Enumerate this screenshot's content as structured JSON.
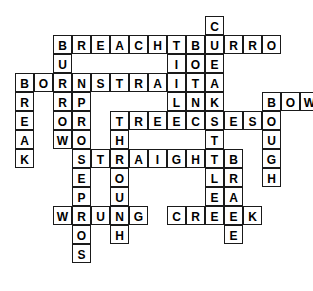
{
  "puzzle": {
    "title": "Crossword Grid",
    "grid": {
      "cell_size": 19,
      "origin_x": 15,
      "origin_y": 16,
      "columns": 16,
      "rows": 15,
      "cell_background": "#ffffff",
      "cell_border": "#1a1a1a",
      "letter_color": "#000000",
      "page_background": "#ffffff"
    },
    "entries": [
      {
        "word": "CREAK",
        "direction": "down",
        "col": 10,
        "row": 0
      },
      {
        "word": "BREACHES",
        "direction": "across",
        "col": 2,
        "row": 1
      },
      {
        "word": "BURRO",
        "direction": "across",
        "col": 9,
        "row": 1
      },
      {
        "word": "BORNE",
        "direction": "down",
        "col": 9,
        "row": 1
      },
      {
        "word": "BURROW",
        "direction": "down",
        "col": 2,
        "row": 1
      },
      {
        "word": "TILL",
        "direction": "down",
        "col": 8,
        "row": 1
      },
      {
        "word": "BORN",
        "direction": "across",
        "col": 0,
        "row": 3
      },
      {
        "word": "STRAIT",
        "direction": "across",
        "col": 4,
        "row": 3
      },
      {
        "word": "BREAK",
        "direction": "down",
        "col": 0,
        "row": 3
      },
      {
        "word": "PROSE",
        "direction": "down",
        "col": 3,
        "row": 4
      },
      {
        "word": "BOW",
        "direction": "across",
        "col": 13,
        "row": 4
      },
      {
        "word": "BOUGH",
        "direction": "down",
        "col": 13,
        "row": 4
      },
      {
        "word": "BREECHES",
        "direction": "across",
        "col": 5,
        "row": 5
      },
      {
        "word": "STYLE",
        "direction": "down",
        "col": 10,
        "row": 5
      },
      {
        "word": "STRAIGHT",
        "direction": "across",
        "col": 3,
        "row": 7
      },
      {
        "word": "THROUGH",
        "direction": "down",
        "col": 5,
        "row": 5
      },
      {
        "word": "BRAKE",
        "direction": "down",
        "col": 11,
        "row": 7
      },
      {
        "word": "PROS",
        "direction": "down",
        "col": 3,
        "row": 9
      },
      {
        "word": "WRUNG",
        "direction": "across",
        "col": 2,
        "row": 10
      },
      {
        "word": "CREEK",
        "direction": "across",
        "col": 8,
        "row": 10
      }
    ],
    "letters": [
      {
        "ch": "C",
        "col": 10,
        "row": 0
      },
      {
        "ch": "B",
        "col": 2,
        "row": 1
      },
      {
        "ch": "R",
        "col": 3,
        "row": 1
      },
      {
        "ch": "E",
        "col": 4,
        "row": 1
      },
      {
        "ch": "A",
        "col": 5,
        "row": 1
      },
      {
        "ch": "C",
        "col": 6,
        "row": 1
      },
      {
        "ch": "H",
        "col": 7,
        "row": 1
      },
      {
        "ch": "E",
        "col": 8,
        "row": 1
      },
      {
        "ch": "S",
        "col": 9,
        "row": 1
      },
      {
        "ch": "B",
        "col": 9,
        "row": 1,
        "skip": true
      },
      {
        "ch": "B",
        "col": 9.45,
        "row": 1,
        "hidden": true
      },
      {
        "ch": "U",
        "col": 2,
        "row": 2
      },
      {
        "ch": "T",
        "col": 8,
        "row": 2
      },
      {
        "ch": "B",
        "col": 0,
        "row": 3
      },
      {
        "ch": "O",
        "col": 1,
        "row": 3
      },
      {
        "ch": "R",
        "col": 2,
        "row": 3
      },
      {
        "ch": "N",
        "col": 3,
        "row": 3
      },
      {
        "ch": "S",
        "col": 4,
        "row": 3
      },
      {
        "ch": "T",
        "col": 5,
        "row": 3
      },
      {
        "ch": "R",
        "col": 6,
        "row": 3
      },
      {
        "ch": "A",
        "col": 7,
        "row": 3
      },
      {
        "ch": "I",
        "col": 8,
        "row": 3
      },
      {
        "ch": "T",
        "col": 9,
        "row": 3
      },
      {
        "ch": "R",
        "col": 0,
        "row": 4
      },
      {
        "ch": "R",
        "col": 2,
        "row": 4
      },
      {
        "ch": "P",
        "col": 3,
        "row": 4
      },
      {
        "ch": "L",
        "col": 8,
        "row": 4
      },
      {
        "ch": "E",
        "col": 0,
        "row": 5
      },
      {
        "ch": "R",
        "col": 2,
        "row": 5
      },
      {
        "ch": "R",
        "col": 3,
        "row": 5
      },
      {
        "ch": "B",
        "col": 5,
        "row": 5
      },
      {
        "ch": "R",
        "col": 6,
        "row": 5
      },
      {
        "ch": "E",
        "col": 7,
        "row": 5
      },
      {
        "ch": "E",
        "col": 8,
        "row": 5
      },
      {
        "ch": "C",
        "col": 9,
        "row": 5
      },
      {
        "ch": "H",
        "col": 10,
        "row": 5
      },
      {
        "ch": "E",
        "col": 11,
        "row": 5
      },
      {
        "ch": "S",
        "col": 12,
        "row": 5
      },
      {
        "ch": "A",
        "col": 0,
        "row": 6
      },
      {
        "ch": "O",
        "col": 2,
        "row": 6
      },
      {
        "ch": "O",
        "col": 3,
        "row": 6
      },
      {
        "ch": "O",
        "col": 5,
        "row": 6
      },
      {
        "ch": "T",
        "col": 12,
        "row": 6
      },
      {
        "ch": "K",
        "col": 0,
        "row": 7
      },
      {
        "ch": "S",
        "col": 3,
        "row": 7
      },
      {
        "ch": "T",
        "col": 4,
        "row": 7
      },
      {
        "ch": "R",
        "col": 5,
        "row": 7
      },
      {
        "ch": "A",
        "col": 6,
        "row": 7
      },
      {
        "ch": "I",
        "col": 7,
        "row": 7
      },
      {
        "ch": "G",
        "col": 8,
        "row": 7
      },
      {
        "ch": "H",
        "col": 9,
        "row": 7
      },
      {
        "ch": "T",
        "col": 10,
        "row": 7
      },
      {
        "ch": "Y",
        "col": 12,
        "row": 7
      },
      {
        "ch": "E",
        "col": 3,
        "row": 8
      },
      {
        "ch": "O",
        "col": 5,
        "row": 8
      },
      {
        "ch": "P",
        "col": 3,
        "row": 9
      },
      {
        "ch": "U",
        "col": 5,
        "row": 9
      },
      {
        "ch": "W",
        "col": 2,
        "row": 10
      },
      {
        "ch": "R",
        "col": 3,
        "row": 10
      },
      {
        "ch": "U",
        "col": 4,
        "row": 10
      },
      {
        "ch": "N",
        "col": 5,
        "row": 10
      },
      {
        "ch": "G",
        "col": 6,
        "row": 10
      },
      {
        "ch": "O",
        "col": 3,
        "row": 11
      },
      {
        "ch": "H",
        "col": 5,
        "row": 11
      },
      {
        "ch": "S",
        "col": 3,
        "row": 12
      }
    ]
  }
}
